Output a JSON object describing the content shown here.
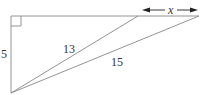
{
  "diagram": {
    "type": "geometry-right-triangle",
    "labels": {
      "vertical_side": "5",
      "inner_hypotenuse": "13",
      "outer_hypotenuse": "15",
      "extension": "x"
    },
    "colors": {
      "line": "#888888",
      "text": "#333333",
      "arrow": "#222222"
    }
  }
}
